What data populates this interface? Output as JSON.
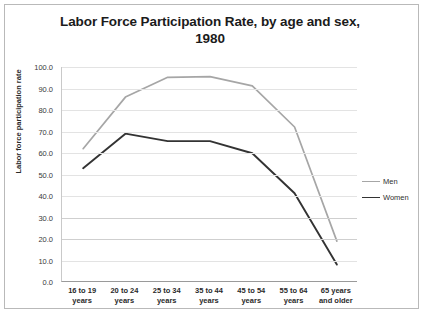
{
  "chart_data": {
    "type": "line",
    "title": "Labor Force Participation Rate, by age and sex, 1980",
    "title_line1": "Labor Force Participation Rate, by age and sex,",
    "title_line2": "1980",
    "xlabel": "",
    "ylabel": "Labor force participation rate",
    "ylim": [
      0,
      100
    ],
    "ytick_labels": [
      "100.0",
      "90.0",
      "80.0",
      "70.0",
      "60.0",
      "50.0",
      "40.0",
      "30.0",
      "20.0",
      "10.0",
      "0.0"
    ],
    "ytick_values": [
      100,
      90,
      80,
      70,
      60,
      50,
      40,
      30,
      20,
      10,
      0
    ],
    "grid": true,
    "legend_position": "right",
    "categories": [
      "16 to 19\nyears",
      "20 to 24\nyears",
      "25 to 34\nyears",
      "35 to 44\nyears",
      "45 to 54\nyears",
      "55 to 64\nyears",
      "65 years\nand older"
    ],
    "series": [
      {
        "name": "Men",
        "color": "#a6a6a6",
        "values": [
          62.0,
          86.0,
          95.2,
          95.5,
          91.2,
          72.1,
          19.0
        ]
      },
      {
        "name": "Women",
        "color": "#333333",
        "values": [
          52.9,
          69.0,
          65.5,
          65.5,
          59.9,
          41.3,
          8.1
        ]
      }
    ]
  },
  "legend": {
    "items": [
      {
        "label": "Men",
        "color": "#a6a6a6"
      },
      {
        "label": "Women",
        "color": "#333333"
      }
    ]
  }
}
